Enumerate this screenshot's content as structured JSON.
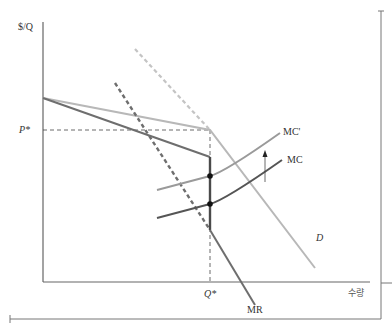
{
  "diagram": {
    "type": "kinked-demand-oligopoly",
    "axes": {
      "y_label": "$/Q",
      "x_label": "수량"
    },
    "equilibrium": {
      "price_label": "P*",
      "quantity_label": "Q*"
    },
    "curves": [
      {
        "name": "D",
        "label": "D",
        "style": "solid light gray with dashed upper extension",
        "color": "#b8b8b8"
      },
      {
        "name": "MR",
        "label": "MR",
        "style": "solid dark gray with dashed extension and vertical gap",
        "color": "#6e6e6e"
      },
      {
        "name": "MC'",
        "label": "MC'",
        "style": "solid medium gray",
        "color": "#9a9a9a"
      },
      {
        "name": "MC",
        "label": "MC",
        "style": "solid dark gray",
        "color": "#555555"
      }
    ],
    "annotations": [
      {
        "type": "arrow",
        "description": "upward shift from MC to MC'"
      },
      {
        "type": "points",
        "description": "intersections of MC and MC' with vertical MR gap at Q*"
      }
    ],
    "colors": {
      "axis": "#555555",
      "demand": "#b8b8b8",
      "mr": "#6e6e6e",
      "mc_prime": "#9a9a9a",
      "mc": "#555555",
      "guide_dash": "#444444"
    }
  }
}
